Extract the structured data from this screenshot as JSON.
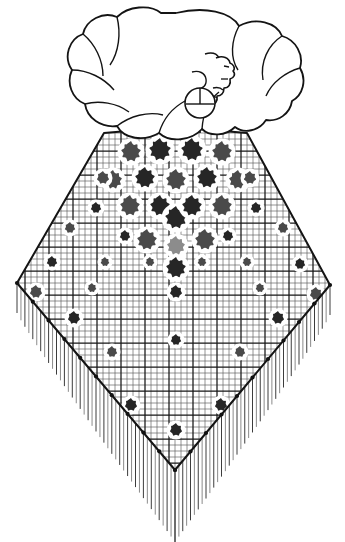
{
  "illustration": {
    "title": "Woman wearing fringed triangular shawl",
    "description": "Black and white line drawing of a woman in profile with bouffant curly hair and a hoop earring, wearing a large triangular mesh shawl decorated with scalloped flower motifs and a long fringe border.",
    "background_color": "#ffffff",
    "ink_color": "#111111"
  },
  "figure": {
    "head": {
      "label": "head-profile",
      "facing": "right",
      "hair_style": "bouffant curls",
      "earring": "hoop"
    },
    "neck": {
      "label": "neck"
    }
  },
  "shawl": {
    "label": "triangular-shawl",
    "outline_color": "#141414",
    "mesh": {
      "label": "grid-mesh",
      "fine_cell_px": 6,
      "heavy_every": 4,
      "fine_color": "#5a5a5a",
      "heavy_color": "#161616"
    },
    "geometry": {
      "apex_x": 175,
      "apex_y": 127,
      "left_shoulder_x": 104,
      "left_shoulder_y": 133,
      "right_shoulder_x": 247,
      "right_shoulder_y": 133,
      "left_corner_x": 17,
      "left_corner_y": 283,
      "right_corner_x": 330,
      "right_corner_y": 285,
      "bottom_point_x": 175,
      "bottom_point_y": 470
    },
    "fringe": {
      "label": "fringe-threads",
      "color": "#3c3c3c",
      "max_length_px": 72,
      "min_length_px": 30,
      "spacing_px": 6
    },
    "beads": {
      "label": "edge-beads",
      "color": "#121212"
    }
  },
  "motifs": {
    "dark_color": "#262626",
    "mid_color": "#4a4a4a",
    "light_color": "#8c8c8c",
    "flowers": [
      {
        "x": 131,
        "y": 152,
        "r": 11,
        "tone": "mid"
      },
      {
        "x": 160,
        "y": 150,
        "r": 12,
        "tone": "dark"
      },
      {
        "x": 192,
        "y": 150,
        "r": 12,
        "tone": "dark"
      },
      {
        "x": 222,
        "y": 152,
        "r": 11,
        "tone": "mid"
      },
      {
        "x": 113,
        "y": 180,
        "r": 10,
        "tone": "mid"
      },
      {
        "x": 145,
        "y": 178,
        "r": 11,
        "tone": "dark"
      },
      {
        "x": 176,
        "y": 180,
        "r": 11,
        "tone": "mid"
      },
      {
        "x": 207,
        "y": 178,
        "r": 11,
        "tone": "dark"
      },
      {
        "x": 238,
        "y": 180,
        "r": 10,
        "tone": "mid"
      },
      {
        "x": 130,
        "y": 206,
        "r": 11,
        "tone": "mid"
      },
      {
        "x": 160,
        "y": 206,
        "r": 11,
        "tone": "dark"
      },
      {
        "x": 176,
        "y": 218,
        "r": 12,
        "tone": "dark"
      },
      {
        "x": 192,
        "y": 206,
        "r": 11,
        "tone": "dark"
      },
      {
        "x": 222,
        "y": 206,
        "r": 11,
        "tone": "mid"
      },
      {
        "x": 147,
        "y": 240,
        "r": 11,
        "tone": "mid"
      },
      {
        "x": 176,
        "y": 246,
        "r": 10,
        "tone": "light"
      },
      {
        "x": 205,
        "y": 240,
        "r": 11,
        "tone": "mid"
      },
      {
        "x": 176,
        "y": 268,
        "r": 11,
        "tone": "dark"
      },
      {
        "x": 103,
        "y": 178,
        "r": 7,
        "tone": "mid"
      },
      {
        "x": 250,
        "y": 178,
        "r": 7,
        "tone": "mid"
      },
      {
        "x": 96,
        "y": 208,
        "r": 6,
        "tone": "dark"
      },
      {
        "x": 256,
        "y": 208,
        "r": 6,
        "tone": "dark"
      },
      {
        "x": 125,
        "y": 236,
        "r": 6,
        "tone": "dark"
      },
      {
        "x": 228,
        "y": 236,
        "r": 6,
        "tone": "dark"
      },
      {
        "x": 150,
        "y": 262,
        "r": 5,
        "tone": "mid"
      },
      {
        "x": 202,
        "y": 262,
        "r": 5,
        "tone": "mid"
      },
      {
        "x": 176,
        "y": 292,
        "r": 7,
        "tone": "dark"
      },
      {
        "x": 105,
        "y": 262,
        "r": 5,
        "tone": "mid"
      },
      {
        "x": 247,
        "y": 262,
        "r": 5,
        "tone": "mid"
      },
      {
        "x": 70,
        "y": 228,
        "r": 6,
        "tone": "mid"
      },
      {
        "x": 283,
        "y": 228,
        "r": 6,
        "tone": "mid"
      },
      {
        "x": 52,
        "y": 262,
        "r": 6,
        "tone": "dark"
      },
      {
        "x": 300,
        "y": 264,
        "r": 6,
        "tone": "dark"
      },
      {
        "x": 36,
        "y": 292,
        "r": 7,
        "tone": "mid"
      },
      {
        "x": 316,
        "y": 294,
        "r": 7,
        "tone": "mid"
      },
      {
        "x": 74,
        "y": 318,
        "r": 7,
        "tone": "dark"
      },
      {
        "x": 278,
        "y": 318,
        "r": 7,
        "tone": "dark"
      },
      {
        "x": 112,
        "y": 352,
        "r": 6,
        "tone": "mid"
      },
      {
        "x": 240,
        "y": 352,
        "r": 6,
        "tone": "mid"
      },
      {
        "x": 131,
        "y": 405,
        "r": 7,
        "tone": "dark"
      },
      {
        "x": 221,
        "y": 405,
        "r": 7,
        "tone": "dark"
      },
      {
        "x": 176,
        "y": 430,
        "r": 7,
        "tone": "dark"
      },
      {
        "x": 176,
        "y": 340,
        "r": 6,
        "tone": "dark"
      },
      {
        "x": 92,
        "y": 288,
        "r": 5,
        "tone": "mid"
      },
      {
        "x": 260,
        "y": 288,
        "r": 5,
        "tone": "mid"
      }
    ]
  }
}
